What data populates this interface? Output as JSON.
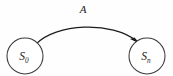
{
  "diagram": {
    "type": "state-transition-graph",
    "background_color": "#fefefe",
    "stroke_color": "#1c1c1c",
    "node_stroke_color": "#3a3a3a",
    "node_fill_color": "#ffffff",
    "nodes": [
      {
        "id": "start-state",
        "base": "S",
        "subscript": "0",
        "cx": 25,
        "cy": 56,
        "r": 18
      },
      {
        "id": "end-state",
        "base": "S",
        "subscript": "n",
        "cx": 147,
        "cy": 56,
        "r": 18
      }
    ],
    "edges": [
      {
        "id": "transition-a",
        "label": "A",
        "from": "start-state",
        "to": "end-state",
        "label_x": 83,
        "label_y": 12,
        "directed": true
      }
    ]
  }
}
